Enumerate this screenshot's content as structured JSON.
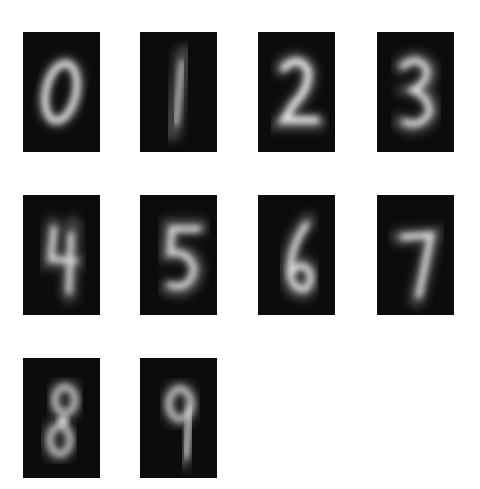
{
  "figure": {
    "title": "",
    "background": "#ffffff",
    "tile_background": "#0c0c0c",
    "tile_foreground": "#f2f2f2",
    "layout": {
      "rows": 3,
      "cols": 4,
      "tile_width": 77,
      "tile_height": 120
    }
  },
  "tiles": [
    {
      "digit": "0",
      "x": 23,
      "y": 32
    },
    {
      "digit": "1",
      "x": 140,
      "y": 32
    },
    {
      "digit": "2",
      "x": 258,
      "y": 32
    },
    {
      "digit": "3",
      "x": 377,
      "y": 32
    },
    {
      "digit": "4",
      "x": 23,
      "y": 195
    },
    {
      "digit": "5",
      "x": 140,
      "y": 195
    },
    {
      "digit": "6",
      "x": 258,
      "y": 195
    },
    {
      "digit": "7",
      "x": 377,
      "y": 195
    },
    {
      "digit": "8",
      "x": 23,
      "y": 358
    },
    {
      "digit": "9",
      "x": 140,
      "y": 358
    }
  ]
}
